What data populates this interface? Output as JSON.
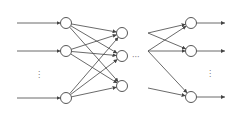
{
  "diagram": {
    "type": "feedforward-neural-network",
    "layers": [
      {
        "name": "input",
        "visible_nodes": 3,
        "ellipsis": "vertical"
      },
      {
        "name": "hidden-1",
        "visible_nodes": 3,
        "ellipsis": "horizontal"
      },
      {
        "name": "output",
        "visible_nodes": 3,
        "ellipsis": "vertical"
      }
    ],
    "ellipsis": {
      "vertical": "⋮",
      "horizontal": "···"
    },
    "colors": {
      "stroke": "#444444",
      "background": "#ffffff"
    }
  }
}
